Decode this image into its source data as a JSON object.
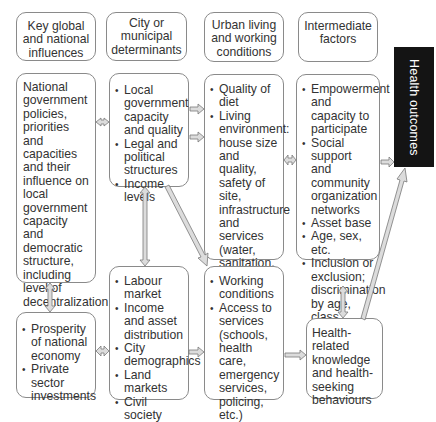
{
  "headers": [
    {
      "label": "Key global and national influences"
    },
    {
      "label": "City or municipal determinants"
    },
    {
      "label": "Urban living and working conditions"
    },
    {
      "label": "Intermediate factors"
    }
  ],
  "boxes": {
    "national_policies": {
      "text": "National government policies, priorities and capacities and their influence on local government capacity and democratic structure, including level of decentralization"
    },
    "national_economy": {
      "items": [
        "Prosperity of national economy",
        "Private sector investments"
      ]
    },
    "city_governance": {
      "items": [
        "Local government capacity and quality",
        "Legal and political structures",
        "Income levels"
      ]
    },
    "city_economy": {
      "items": [
        "Labour market",
        "Income and asset distribution",
        "City demographics",
        "Land markets",
        "Civil society"
      ]
    },
    "living_conditions": {
      "items": [
        "Quality of diet",
        "Living environment: house size and quality, safety of site, infrastructure and services (water, sanitation, solid waste collection, drainage, etc.)"
      ]
    },
    "working_conditions": {
      "items": [
        "Working conditions",
        "Access to services (schools, health care, emergency services, policing, etc.)"
      ]
    },
    "intermediate": {
      "items": [
        "Empowerment and capacity to participate",
        "Social support and community organization networks",
        "Asset base",
        "Age, sex, etc.",
        "Inclusion or exclusion; discrimination by age, class, home area, gender, etc."
      ]
    },
    "health_behaviour": {
      "text": "Health-related knowledge and health-seeking behaviours"
    }
  },
  "outcome": {
    "label": "Health outcomes",
    "background": "#141414",
    "color": "#ffffff"
  },
  "arrow_color": {
    "fill": "#dcdcdc",
    "stroke": "#7a7a7a"
  }
}
